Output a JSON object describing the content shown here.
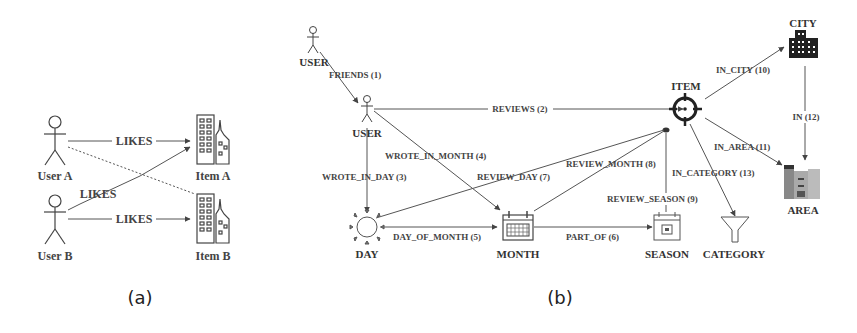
{
  "panel_a": {
    "caption": "(a)",
    "nodes": {
      "user_a": "User A",
      "user_b": "User B",
      "item_a": "Item A",
      "item_b": "Item B"
    },
    "edges": {
      "user_a_item_a": "LIKES",
      "user_b_item_a": "LIKES",
      "user_b_item_b": "LIKES"
    }
  },
  "panel_b": {
    "caption": "(b)",
    "nodes": {
      "user_top": "USER",
      "user": "USER",
      "item": "ITEM",
      "city": "CITY",
      "area": "AREA",
      "day": "DAY",
      "month": "MONTH",
      "season": "SEASON",
      "category": "CATEGORY"
    },
    "edges": {
      "friends": "FRIENDS (1)",
      "reviews": "REVIEWS (2)",
      "wrote_in_day": "WROTE_IN_DAY (3)",
      "wrote_in_month": "WROTE_IN_MONTH (4)",
      "day_of_month": "DAY_OF_MONTH (5)",
      "part_of": "PART_OF (6)",
      "review_day": "REVIEW_DAY (7)",
      "review_month": "REVIEW_MONTH (8)",
      "review_season": "REVIEW_SEASON (9)",
      "in_city": "IN_CITY (10)",
      "in_area": "IN_AREA (11)",
      "in": "IN (12)",
      "in_category": "IN_CATEGORY (13)"
    }
  }
}
